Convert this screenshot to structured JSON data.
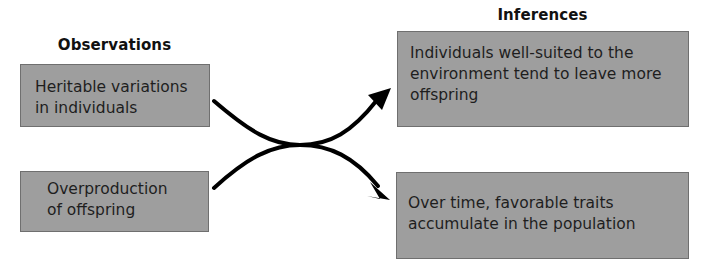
{
  "diagram": {
    "observations": {
      "heading": "Observations",
      "items": [
        {
          "lines": [
            "Heritable variations",
            "in individuals"
          ]
        },
        {
          "lines": [
            "Overproduction",
            "of offspring"
          ]
        }
      ]
    },
    "inferences": {
      "heading": "Inferences",
      "items": [
        {
          "lines": [
            "Individuals well-suited to the",
            "environment tend to leave more",
            "offspring"
          ]
        },
        {
          "lines": [
            "Over time, favorable traits",
            "accumulate in the population"
          ]
        }
      ]
    },
    "colors": {
      "box_fill": "#9e9e9e",
      "box_border": "#6f6f6f",
      "arrow": "#000000",
      "background": "#ffffff"
    }
  }
}
